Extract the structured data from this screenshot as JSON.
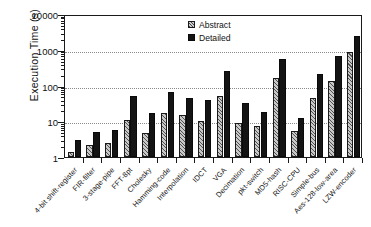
{
  "chart_data": {
    "type": "bar",
    "title": "",
    "xlabel": "",
    "ylabel": "Execution Time (s)",
    "yscale": "log",
    "ylim": [
      1,
      10000
    ],
    "yticks": [
      1,
      10,
      100,
      1000,
      10000
    ],
    "ytick_labels": [
      "1",
      "10",
      "100",
      "1000",
      "10000"
    ],
    "grid": true,
    "grid_axis": "y",
    "legend_position": "top-center",
    "categories": [
      "4-bit shift-register",
      "FIR-filter",
      "3-stage-pipe",
      "FFT-8pt",
      "Cholesky",
      "Hamming-code",
      "Interpolation",
      "IDCT",
      "VGA",
      "Decimation",
      "pkt-switch",
      "MD5-hash",
      "RISC-CPU",
      "Simple-bus",
      "Aes-128-low-area",
      "LZW-encoder"
    ],
    "series": [
      {
        "name": "Abstract",
        "color": "#c9c9c9",
        "pattern": "hatched",
        "values": [
          1.4,
          2.1,
          2.5,
          11,
          4.8,
          17,
          14.5,
          10.5,
          50,
          8.8,
          7.5,
          160,
          5.5,
          45,
          130,
          850
        ]
      },
      {
        "name": "Detailed",
        "color": "#141414",
        "pattern": "solid",
        "values": [
          3.0,
          4.9,
          5.8,
          50,
          16.5,
          68,
          45,
          39,
          250,
          32,
          18.5,
          560,
          12,
          210,
          670,
          2400
        ]
      }
    ]
  },
  "legend": {
    "entries": [
      {
        "label": "Abstract"
      },
      {
        "label": "Detailed"
      }
    ]
  }
}
